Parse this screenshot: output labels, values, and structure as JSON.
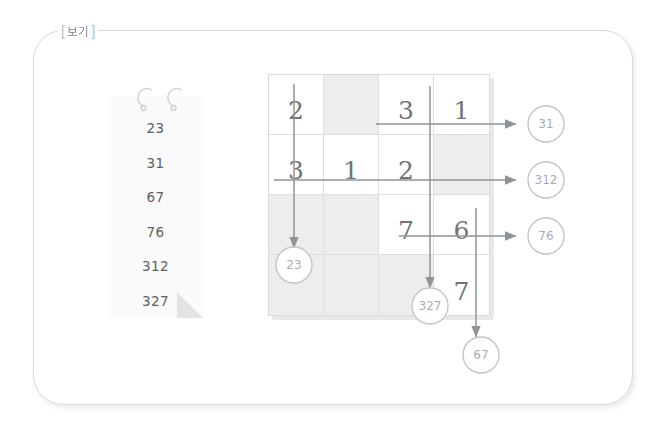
{
  "frame": {
    "tab_bracket_left": "[",
    "tab_bracket_right": "]",
    "tab_label": "보기"
  },
  "note_card": {
    "name": "answer-note",
    "hook_icon_left": "ring-hook-icon",
    "hook_icon_right": "ring-hook-icon",
    "fold_icon": "page-fold-icon",
    "items": [
      {
        "value": "23"
      },
      {
        "value": "31"
      },
      {
        "value": "67"
      },
      {
        "value": "76"
      },
      {
        "value": "312"
      },
      {
        "value": "327"
      }
    ]
  },
  "grid": {
    "rows": 4,
    "cols": 4,
    "shaded_cells": [
      [
        1,
        2
      ],
      [
        2,
        4
      ],
      [
        3,
        1
      ],
      [
        3,
        2
      ],
      [
        4,
        1
      ],
      [
        4,
        2
      ],
      [
        4,
        3
      ]
    ],
    "cells": [
      [
        {
          "digit": "2"
        },
        {
          "digit": ""
        },
        {
          "digit": "3"
        },
        {
          "digit": "1"
        }
      ],
      [
        {
          "digit": "3"
        },
        {
          "digit": "1"
        },
        {
          "digit": "2"
        },
        {
          "digit": ""
        }
      ],
      [
        {
          "digit": ""
        },
        {
          "digit": ""
        },
        {
          "digit": "7"
        },
        {
          "digit": "6"
        }
      ],
      [
        {
          "digit": ""
        },
        {
          "digit": ""
        },
        {
          "digit": ""
        },
        {
          "digit": "7"
        }
      ]
    ]
  },
  "arrows": {
    "right_row1": {
      "result": "31",
      "direction": "right",
      "icon": "arrow-right-icon"
    },
    "right_row2": {
      "result": "312",
      "direction": "right",
      "icon": "arrow-right-icon"
    },
    "right_row3": {
      "result": "76",
      "direction": "right",
      "icon": "arrow-right-icon"
    },
    "down_col1": {
      "result": "23",
      "direction": "down",
      "icon": "arrow-down-icon"
    },
    "down_col3": {
      "result": "327",
      "direction": "down",
      "icon": "arrow-down-icon"
    },
    "down_col4": {
      "result": "67",
      "direction": "down",
      "icon": "arrow-down-icon"
    }
  },
  "colors": {
    "frame_border": "#d6d8da",
    "grid_line": "#dcdee0",
    "shaded_cell": "#ededed",
    "digit": "#6f7477",
    "arrow": "#8f9498",
    "bubble_stroke": "#c2c6ca",
    "bubble_text": "#a9adb1",
    "note_bg": "#fafafa"
  }
}
